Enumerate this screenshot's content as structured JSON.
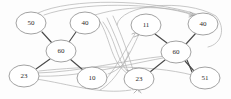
{
  "diagram": {
    "background_color": "#fdfdfd",
    "node_fill": "#ffffff",
    "node_stroke": "#8a8a8a",
    "solid_edge_color": "#4a4a4a",
    "curved_edge_color": "#b0b0b0",
    "label_color": "#2b2b2b",
    "nodes": [
      {
        "id": "n0",
        "label": "50",
        "cx": 31,
        "cy": 23,
        "rx": 15,
        "ry": 11
      },
      {
        "id": "n1",
        "label": "40",
        "cx": 85,
        "cy": 23,
        "rx": 15,
        "ry": 11
      },
      {
        "id": "n2",
        "label": "60",
        "cx": 61,
        "cy": 51,
        "rx": 15,
        "ry": 11
      },
      {
        "id": "n3",
        "label": "23",
        "cx": 24,
        "cy": 76,
        "rx": 15,
        "ry": 11
      },
      {
        "id": "n4",
        "label": "10",
        "cx": 92,
        "cy": 78,
        "rx": 15,
        "ry": 11
      },
      {
        "id": "n5",
        "label": "11",
        "cx": 146,
        "cy": 25,
        "rx": 15,
        "ry": 11
      },
      {
        "id": "n6",
        "label": "40",
        "cx": 203,
        "cy": 24,
        "rx": 15,
        "ry": 11
      },
      {
        "id": "n7",
        "label": "60",
        "cx": 176,
        "cy": 52,
        "rx": 15,
        "ry": 11
      },
      {
        "id": "n8",
        "label": "23",
        "cx": 139,
        "cy": 79,
        "rx": 15,
        "ry": 11
      },
      {
        "id": "n9",
        "label": "51",
        "cx": 205,
        "cy": 78,
        "rx": 15,
        "ry": 11
      }
    ],
    "solid_edges": [
      {
        "from": "n0",
        "to": "n2"
      },
      {
        "from": "n1",
        "to": "n2"
      },
      {
        "from": "n3",
        "to": "n2"
      },
      {
        "from": "n4",
        "to": "n2"
      },
      {
        "from": "n5",
        "to": "n7"
      },
      {
        "from": "n6",
        "to": "n7"
      },
      {
        "from": "n8",
        "to": "n7"
      },
      {
        "from": "n9",
        "to": "n7"
      }
    ],
    "curved_edge_count": 12,
    "arrow_count": 6
  }
}
